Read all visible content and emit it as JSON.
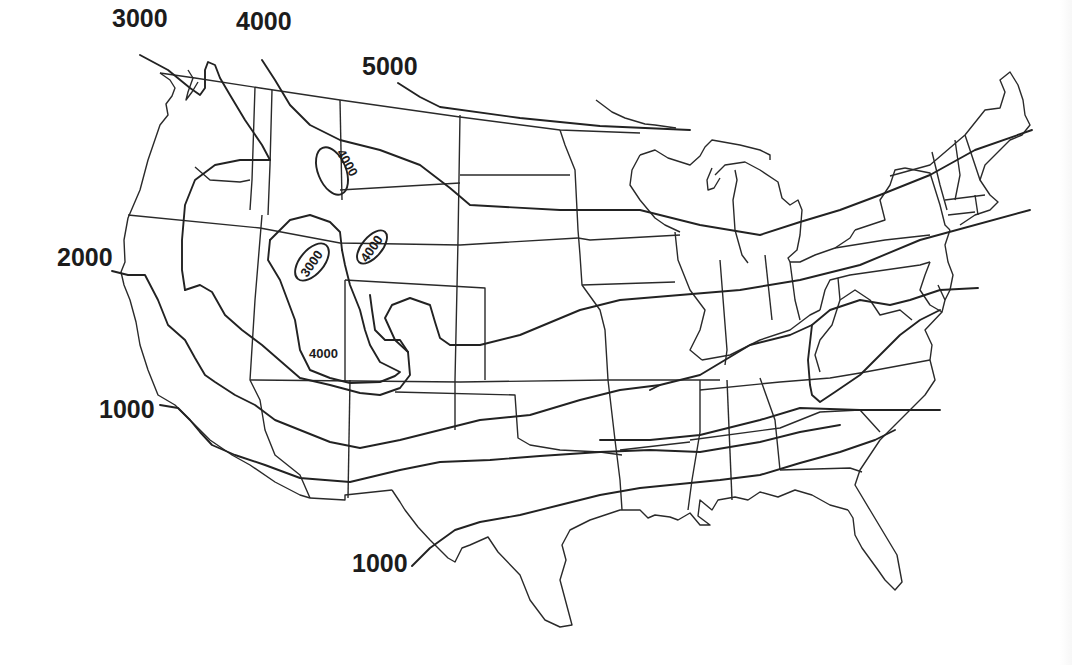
{
  "map": {
    "subject": "Contiguous United States contour (isopleth) map",
    "line_color": "#222222",
    "background": "#ffffff",
    "contour_labels": [
      {
        "id": "w3000",
        "text": "3000",
        "x": 112,
        "y": 27,
        "size": "big"
      },
      {
        "id": "w4000",
        "text": "4000",
        "x": 236,
        "y": 30,
        "size": "big"
      },
      {
        "id": "n5000",
        "text": "5000",
        "x": 362,
        "y": 75,
        "size": "big"
      },
      {
        "id": "w2000",
        "text": "2000",
        "x": 57,
        "y": 266,
        "size": "big"
      },
      {
        "id": "w1000",
        "text": "1000",
        "x": 99,
        "y": 418,
        "size": "big"
      },
      {
        "id": "s1000",
        "text": "1000",
        "x": 352,
        "y": 572,
        "size": "big"
      },
      {
        "id": "mt4000",
        "text": "4000",
        "x": 318,
        "y": 150,
        "size": "small",
        "rotate": 60
      },
      {
        "id": "ut3000",
        "text": "3000",
        "x": 298,
        "y": 265,
        "size": "small",
        "rotate": -55
      },
      {
        "id": "wy4000",
        "text": "4000",
        "x": 360,
        "y": 258,
        "size": "small",
        "rotate": -55
      },
      {
        "id": "co4000",
        "text": "4000",
        "x": 309,
        "y": 358,
        "size": "small",
        "rotate": 0
      }
    ]
  }
}
